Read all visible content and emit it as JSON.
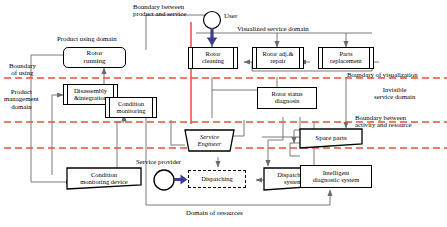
{
  "figure": {
    "colors": {
      "boundary_dashed": "#e8503a",
      "boundary_solid": "#e8503a",
      "connector": "#6b6b6b",
      "arrow_user": "#3b3f8c",
      "node_border": "#000000",
      "background": "#ffffff"
    }
  },
  "nodes": [
    {
      "id": "rotor-running",
      "label": "Rotor\nrunning",
      "shape": "rounded-rect"
    },
    {
      "id": "disassembly",
      "label": "Disassembly\n&integration",
      "shape": "process"
    },
    {
      "id": "condition-monitoring",
      "label": "Condition\nmonitoring",
      "shape": "process"
    },
    {
      "id": "condition-monitoring-device",
      "label": "Condition\nmonitoring device",
      "shape": "document"
    },
    {
      "id": "rotor-cleaning",
      "label": "Rotor\ncleaning",
      "shape": "process"
    },
    {
      "id": "rotor-adj-repair",
      "label": "Rotor adj.&\nrepair",
      "shape": "process"
    },
    {
      "id": "parts-replacement",
      "label": "Parts\nreplacement",
      "shape": "process"
    },
    {
      "id": "rotor-status-diagnosis",
      "label": "Rotor status\ndiagnosis",
      "shape": "rect"
    },
    {
      "id": "service-engineer",
      "label": "Service\nEngineer",
      "shape": "hexagon"
    },
    {
      "id": "dispatching",
      "label": "Dispatching",
      "shape": "dashed-rect"
    },
    {
      "id": "dispatching-system",
      "label": "Dispatching\nsystem",
      "shape": "document"
    },
    {
      "id": "intelligent-diagnostic-system",
      "label": "Intelligent\ndiagnostic system",
      "shape": "rect"
    },
    {
      "id": "spare-parts",
      "label": "Spare parts",
      "shape": "document"
    },
    {
      "id": "user",
      "label": "User",
      "shape": "actor-circle"
    },
    {
      "id": "service-provider",
      "label": "Service provider",
      "shape": "actor-circle"
    }
  ],
  "captions": {
    "boundary_product_service": "Boundary between\nproduct and service",
    "user": "User",
    "visualized_service_domain": "Visualized service domain",
    "product_using_domain": "Product using domain",
    "boundary_of_using": "Boundary\nof using",
    "product_management_domain": "Product\nmanagement\ndomain",
    "boundary_of_visualization": "Boundary of visualization",
    "invisible_service_domain": "Invisible\nservice domain",
    "boundary_activity_resource": "Boundary between\nactivity  and resource",
    "service_provider": "Service provider",
    "domain_of_resources": "Domain of resources"
  }
}
